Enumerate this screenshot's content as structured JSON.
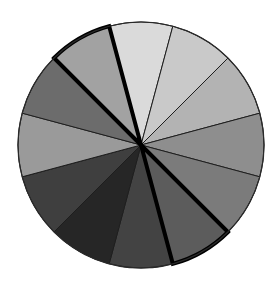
{
  "chart_data": {
    "type": "pie",
    "title": "",
    "center": [
      141,
      145
    ],
    "radius": 123,
    "start_angle_deg": 345,
    "categories": [
      "S1",
      "S2",
      "S3",
      "S4",
      "S5",
      "S6",
      "S7",
      "S8",
      "S9",
      "S10",
      "S11",
      "S12"
    ],
    "values": [
      1,
      1,
      1,
      1,
      1,
      1,
      1,
      1,
      1,
      1,
      1,
      1
    ],
    "colors": [
      "#dadada",
      "#c9c9c9",
      "#b3b3b3",
      "#8e8e8e",
      "#7b7b7b",
      "#5c5c5c",
      "#434343",
      "#262626",
      "#3f3f3f",
      "#9a9a9a",
      "#6c6c6c",
      "#a2a2a2"
    ],
    "highlighted": [
      5,
      11
    ],
    "legend": [],
    "grid": false
  }
}
